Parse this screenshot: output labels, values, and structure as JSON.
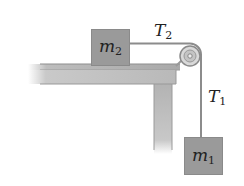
{
  "diagram": {
    "masses": [
      {
        "id": "m2",
        "symbol": "m",
        "subscript": "2",
        "location": "on table"
      },
      {
        "id": "m1",
        "symbol": "m",
        "subscript": "1",
        "location": "hanging"
      }
    ],
    "tensions": [
      {
        "id": "T2",
        "symbol": "T",
        "subscript": "2",
        "segment": "horizontal"
      },
      {
        "id": "T1",
        "symbol": "T",
        "subscript": "1",
        "segment": "vertical"
      }
    ],
    "colors": {
      "block": "#9a9a9a",
      "table": "#b4b4b4",
      "string": "#8c8c8c",
      "pulley": "#c8c8c8",
      "text": "#222222"
    }
  }
}
